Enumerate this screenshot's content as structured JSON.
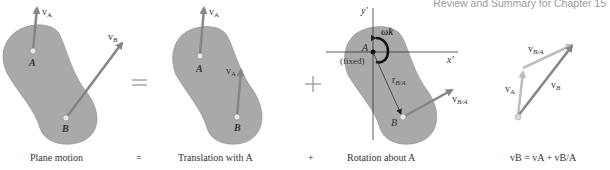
{
  "header": {
    "text": "Review and Summary for Chapter 15"
  },
  "panels": {
    "plane": {
      "point_a": "A",
      "point_b": "B",
      "v_a": "v",
      "v_a_sub": "A",
      "v_b": "v",
      "v_b_sub": "B"
    },
    "translation": {
      "point_a": "A",
      "point_b": "B",
      "v_a": "v",
      "v_a_sub": "A",
      "v_a2": "v",
      "v_a2_sub": "A"
    },
    "rotation": {
      "axis_y": "y′",
      "axis_x": "x′",
      "omega": "ωk",
      "point_a": "A",
      "fixed": "(fixed)",
      "r_ba": "r",
      "r_ba_sub": "B/A",
      "point_b": "B",
      "v_ba": "v",
      "v_ba_sub": "B/A"
    },
    "vector_sum": {
      "v_ba": "v",
      "v_ba_sub": "B/A",
      "v_a": "v",
      "v_a_sub": "A",
      "v_b": "v",
      "v_b_sub": "B"
    }
  },
  "operators": {
    "equals": "=",
    "plus": "+"
  },
  "captions": {
    "plane": "Plane motion",
    "eq": "=",
    "translation": "Translation with A",
    "plus": "+",
    "rotation": "Rotation about A",
    "equation": "vB = vA + vB/A"
  },
  "colors": {
    "body_fill": "#a9a9a9",
    "body_stroke": "#8c8c8c",
    "arrow_dark": "#858585",
    "arrow_light": "#bdbdbd",
    "text": "#333333"
  }
}
